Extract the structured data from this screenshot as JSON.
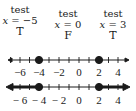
{
  "tests": [
    {
      "label": "test",
      "var": "x",
      "eq": " = ",
      "value": "−5",
      "result": "T",
      "center_x": 20
    },
    {
      "label": "test",
      "var": "x",
      "eq": " = ",
      "value": "0",
      "result": "F",
      "center_x": 68
    },
    {
      "label": "test",
      "var": "x",
      "eq": " = ",
      "value": "3",
      "result": "T",
      "center_x": 113
    }
  ],
  "number_lines": [
    {
      "name": "test-points-line",
      "ticks": [
        -7,
        -6,
        -5,
        -4,
        -3,
        -2,
        -1,
        0,
        1,
        2,
        3,
        4,
        5
      ],
      "labels": [
        "−6",
        "−4",
        "−2",
        "0",
        "2",
        "4"
      ],
      "label_values": [
        -6,
        -4,
        -2,
        0,
        2,
        4
      ],
      "closed_points": [
        -4,
        2
      ],
      "shaded": []
    },
    {
      "name": "solution-line",
      "ticks": [
        -7,
        -6,
        -5,
        -4,
        -3,
        -2,
        -1,
        0,
        1,
        2,
        3,
        4,
        5
      ],
      "labels": [
        "− 6",
        "− 4",
        "− 2",
        "0",
        "2",
        "4"
      ],
      "label_values": [
        -6,
        -4,
        -2,
        0,
        2,
        4
      ],
      "closed_points": [
        -4,
        2
      ],
      "shaded": [
        "x <= -4",
        "x >= 2"
      ]
    }
  ],
  "colors": {
    "ink": "#1a1a1a",
    "background": "#ffffff"
  }
}
